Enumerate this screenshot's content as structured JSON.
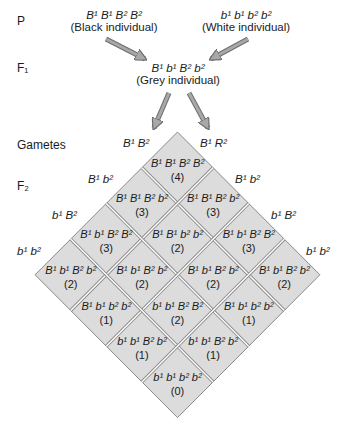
{
  "generations": {
    "p": "P",
    "f1": "F₁",
    "gametes": "Gametes",
    "f2": "F₂"
  },
  "parents": {
    "black": {
      "genotype": "B¹ B¹ B² B²",
      "label": "(Black individual)"
    },
    "white": {
      "genotype": "b¹ b¹ b² b²",
      "label": "(White individual)"
    }
  },
  "f1_individual": {
    "genotype": "B¹ b¹ B² b²",
    "label": "(Grey individual)"
  },
  "gametes_left": [
    "B¹ B²",
    "B¹ b²",
    "b¹ B²",
    "b¹ b²"
  ],
  "gametes_right": [
    "B¹ R²",
    "B¹ b²",
    "b¹ B²",
    "b¹ b²"
  ],
  "colors": {
    "cell_fill": "#dcdcdc",
    "grid_line": "#8a8a8a",
    "arrow_fill": "#a8a8a8",
    "arrow_stroke": "#6e6e6e"
  },
  "cells": [
    {
      "i": 0,
      "j": 0,
      "genotype": "B¹ B¹ B² B²",
      "count": "(4)"
    },
    {
      "i": 0,
      "j": 1,
      "genotype": "B¹ B¹ B² b²",
      "count": "(3)"
    },
    {
      "i": 0,
      "j": 2,
      "genotype": "B¹ b¹ B² B²",
      "count": "(3)"
    },
    {
      "i": 0,
      "j": 3,
      "genotype": "B¹ b¹ B² b²",
      "count": "(2)"
    },
    {
      "i": 1,
      "j": 0,
      "genotype": "B¹ B¹ B² b²",
      "count": "(3)"
    },
    {
      "i": 1,
      "j": 1,
      "genotype": "B¹ B¹ b² b²",
      "count": "(2)"
    },
    {
      "i": 1,
      "j": 2,
      "genotype": "B¹ b¹ B² b²",
      "count": "(2)"
    },
    {
      "i": 1,
      "j": 3,
      "genotype": "B¹ b¹ b² b²",
      "count": "(1)"
    },
    {
      "i": 2,
      "j": 0,
      "genotype": "B¹ b¹ B² B²",
      "count": "(3)"
    },
    {
      "i": 2,
      "j": 1,
      "genotype": "B¹ b¹ B² b²",
      "count": "(2)"
    },
    {
      "i": 2,
      "j": 2,
      "genotype": "b¹ b¹ B² B²",
      "count": "(2)"
    },
    {
      "i": 2,
      "j": 3,
      "genotype": "b¹ b¹ B² b²",
      "count": "(1)"
    },
    {
      "i": 3,
      "j": 0,
      "genotype": "B¹ b¹ B² b²",
      "count": "(2)"
    },
    {
      "i": 3,
      "j": 1,
      "genotype": "B¹ b¹ b² b²",
      "count": "(1)"
    },
    {
      "i": 3,
      "j": 2,
      "genotype": "b¹ b¹ B² b²",
      "count": "(1)"
    },
    {
      "i": 3,
      "j": 3,
      "genotype": "b¹ b¹ b² b²",
      "count": "(0)"
    }
  ]
}
